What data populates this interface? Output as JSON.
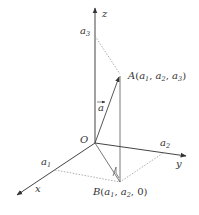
{
  "diagram": {
    "axes": {
      "x_label": "x",
      "y_label": "y",
      "z_label": "z",
      "origin_label": "O"
    },
    "points": {
      "A": {
        "name": "A",
        "coords_text": "(a1, a2, a3)",
        "coords": [
          "a",
          "1",
          "a",
          "2",
          "a",
          "3"
        ]
      },
      "B": {
        "name": "B",
        "coords_text": "(a1, a2, 0)",
        "coords": [
          "a",
          "1",
          "a",
          "2",
          "0"
        ]
      }
    },
    "vector_label": "a",
    "axis_marks": {
      "a1": {
        "base": "a",
        "sub": "1"
      },
      "a2": {
        "base": "a",
        "sub": "2"
      },
      "a3": {
        "base": "a",
        "sub": "3"
      }
    },
    "colors": {
      "axis": "#333333",
      "dotted": "#999999",
      "text": "#333333"
    }
  }
}
